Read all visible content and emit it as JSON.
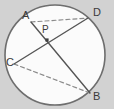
{
  "figure": {
    "kind": "circle-geometry-diagram",
    "canvas": {
      "width": 114,
      "height": 109
    },
    "background_color": "#d2d2d2",
    "circle": {
      "name": "circle",
      "cx": 55,
      "cy": 55,
      "r": 50,
      "fill_color": "#fbfbfb",
      "stroke_color": "#6e6e6e",
      "stroke_width": 1.6
    },
    "points": [
      {
        "id": "A",
        "label": "A",
        "x": 31,
        "y": 22,
        "label_x": 22,
        "label_y": 19
      },
      {
        "id": "D",
        "label": "D",
        "x": 88,
        "y": 18,
        "label_x": 93,
        "label_y": 16
      },
      {
        "id": "C",
        "label": "C",
        "x": 14,
        "y": 64,
        "label_x": 6,
        "label_y": 66
      },
      {
        "id": "B",
        "label": "B",
        "x": 90,
        "y": 93,
        "label_x": 93,
        "label_y": 100
      },
      {
        "id": "P",
        "label": "P",
        "x": 47,
        "y": 40,
        "label_x": 42,
        "label_y": 33
      }
    ],
    "segments": [
      {
        "id": "AB",
        "from": "A",
        "to": "B",
        "style": "solid",
        "stroke_color": "#555555",
        "stroke_width": 1.4
      },
      {
        "id": "CD",
        "from": "C",
        "to": "D",
        "style": "solid",
        "stroke_color": "#555555",
        "stroke_width": 1.4
      },
      {
        "id": "AD",
        "from": "A",
        "to": "D",
        "style": "dashed",
        "stroke_color": "#8a8a8a",
        "stroke_width": 1.2
      },
      {
        "id": "CB",
        "from": "C",
        "to": "B",
        "style": "dashed",
        "stroke_color": "#8a8a8a",
        "stroke_width": 1.2
      }
    ],
    "intersection_marker": {
      "id": "P",
      "x": 47,
      "y": 40,
      "size": 3.2,
      "color": "#3f3f3f"
    },
    "labels": {
      "a": "A",
      "b": "B",
      "c": "C",
      "d": "D",
      "p": "P"
    }
  }
}
